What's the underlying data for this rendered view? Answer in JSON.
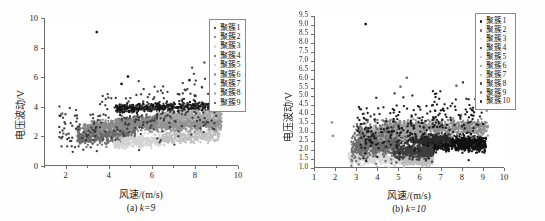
{
  "figure": {
    "background": "#ffffff",
    "axis_color": "#6b6b6b",
    "text_color": "#1a1a1a"
  },
  "chart_data": [
    {
      "id": "a",
      "type": "scatter",
      "title": "",
      "caption_prefix": "(a)",
      "caption_param": "k=9",
      "xlabel": "风速/(m/s)",
      "ylabel": "电压波动/V",
      "xlim": [
        1,
        10
      ],
      "ylim": [
        0,
        10
      ],
      "xticks": [
        2,
        4,
        6,
        8,
        10
      ],
      "xtick_labels": [
        "2",
        "4",
        "6",
        "8",
        "10"
      ],
      "xticks_minor": [
        1,
        3,
        5,
        7,
        9
      ],
      "yticks": [
        0,
        2,
        4,
        6,
        8,
        10
      ],
      "ytick_labels": [
        "0",
        "2",
        "4",
        "6",
        "8",
        "10"
      ],
      "grid": false,
      "legend_position": "top-right",
      "legend_title": "",
      "point_size": 1.15,
      "seed": 20249,
      "series": [
        {
          "name": "聚簇1",
          "color": "#141414",
          "n": 430,
          "shape": "band",
          "xrange": [
            4.3,
            8.9
          ],
          "ycenter_at_xmin": 3.85,
          "ycenter_at_xmax": 4.05,
          "yspread": 0.3,
          "xskew": 0.0
        },
        {
          "name": "聚簇2",
          "color": "#6d6d6d",
          "n": 520,
          "shape": "band",
          "xrange": [
            2.5,
            5.2
          ],
          "ycenter_at_xmin": 1.95,
          "ycenter_at_xmax": 2.35,
          "yspread": 0.55,
          "xskew": 0.0
        },
        {
          "name": "聚簇3",
          "color": "#d3d3d3",
          "n": 300,
          "shape": "band",
          "xrange": [
            4.2,
            6.6
          ],
          "ycenter_at_xmin": 1.55,
          "ycenter_at_xmax": 1.75,
          "yspread": 0.38,
          "xskew": 0.0
        },
        {
          "name": "聚簇4",
          "color": "#4f4f4f",
          "n": 480,
          "shape": "band",
          "xrange": [
            4.4,
            7.2
          ],
          "ycenter_at_xmin": 2.95,
          "ycenter_at_xmax": 3.15,
          "yspread": 0.3,
          "xskew": 0.0
        },
        {
          "name": "聚簇5",
          "color": "#c0c0c0",
          "n": 360,
          "shape": "band",
          "xrange": [
            6.4,
            9.1
          ],
          "ycenter_at_xmin": 1.95,
          "ycenter_at_xmax": 2.15,
          "yspread": 0.45,
          "xskew": 0.0
        },
        {
          "name": "聚簇6",
          "color": "#949494",
          "n": 620,
          "shape": "band",
          "xrange": [
            5.6,
            9.2
          ],
          "ycenter_at_xmin": 2.75,
          "ycenter_at_xmax": 2.9,
          "yspread": 0.38,
          "xskew": 0.0
        },
        {
          "name": "聚簇7",
          "color": "#8a8a8a",
          "n": 540,
          "shape": "band",
          "xrange": [
            2.8,
            6.2
          ],
          "ycenter_at_xmin": 2.55,
          "ycenter_at_xmax": 2.95,
          "yspread": 0.4,
          "xskew": 0.0
        },
        {
          "name": "聚簇8",
          "color": "#a8a8a8",
          "n": 400,
          "shape": "band",
          "xrange": [
            6.2,
            9.2
          ],
          "ycenter_at_xmin": 3.35,
          "ycenter_at_xmax": 3.45,
          "yspread": 0.38,
          "xskew": 0.0
        },
        {
          "name": "聚簇9",
          "color": "#3a3a3a",
          "n": 300,
          "shape": "scatter",
          "xrange": [
            1.6,
            9.0
          ],
          "ycenter_at_xmin": 2.6,
          "ycenter_at_xmax": 4.3,
          "yspread": 0.95,
          "xskew": 0.0
        }
      ],
      "outliers": [
        {
          "x": 3.4,
          "y": 9.05,
          "color": "#141414"
        },
        {
          "x": 4.85,
          "y": 6.05,
          "color": "#141414"
        },
        {
          "x": 4.55,
          "y": 5.55,
          "color": "#141414"
        },
        {
          "x": 7.7,
          "y": 5.8,
          "color": "#141414"
        },
        {
          "x": 1.8,
          "y": 3.55,
          "color": "#7a7a7a"
        },
        {
          "x": 1.85,
          "y": 2.2,
          "color": "#7a7a7a"
        }
      ]
    },
    {
      "id": "b",
      "type": "scatter",
      "title": "",
      "caption_prefix": "(b)",
      "caption_param": "k=10",
      "xlabel": "风速/(m/s)",
      "ylabel": "电压波动/V",
      "xlim": [
        1,
        10
      ],
      "ylim": [
        1.0,
        9.5
      ],
      "xticks": [
        1,
        2,
        3,
        4,
        5,
        6,
        7,
        8,
        9,
        10
      ],
      "xtick_labels": [
        "1",
        "2",
        "3",
        "4",
        "5",
        "6",
        "7",
        "8",
        "9",
        "10"
      ],
      "xticks_minor": [],
      "yticks": [
        1.0,
        1.5,
        2.0,
        2.5,
        3.0,
        3.5,
        4.0,
        4.5,
        5.0,
        5.5,
        6.0,
        6.5,
        7.0,
        7.5,
        8.0,
        8.5,
        9.0,
        9.5
      ],
      "ytick_labels": [
        "1.0",
        "1.5",
        "2.0",
        "2.5",
        "3.0",
        "3.5",
        "4.0",
        "4.5",
        "5.0",
        "5.5",
        "6.0",
        "6.5",
        "7.0",
        "7.5",
        "8.0",
        "8.5",
        "9.0",
        "9.5"
      ],
      "grid": false,
      "legend_position": "top-right",
      "legend_title": "",
      "point_size": 1.15,
      "seed": 77331,
      "series": [
        {
          "name": "聚簇1",
          "color": "#121212",
          "n": 760,
          "shape": "band",
          "xrange": [
            6.1,
            9.1
          ],
          "ycenter_at_xmin": 2.35,
          "ycenter_at_xmax": 2.4,
          "yspread": 0.42,
          "xskew": 0.0
        },
        {
          "name": "聚簇2",
          "color": "#5e5e5e",
          "n": 430,
          "shape": "band",
          "xrange": [
            2.9,
            5.0
          ],
          "ycenter_at_xmin": 2.1,
          "ycenter_at_xmax": 2.3,
          "yspread": 0.5,
          "xskew": 0.0
        },
        {
          "name": "聚簇3",
          "color": "#d8d8d8",
          "n": 520,
          "shape": "band",
          "xrange": [
            2.6,
            6.3
          ],
          "ycenter_at_xmin": 1.55,
          "ycenter_at_xmax": 1.45,
          "yspread": 0.32,
          "xskew": 0.0
        },
        {
          "name": "聚簇4",
          "color": "#2b2b2b",
          "n": 560,
          "shape": "band",
          "xrange": [
            4.8,
            7.4
          ],
          "ycenter_at_xmin": 2.7,
          "ycenter_at_xmax": 2.6,
          "yspread": 0.28,
          "xskew": 0.0
        },
        {
          "name": "聚簇5",
          "color": "#bdbdbd",
          "n": 300,
          "shape": "band",
          "xrange": [
            5.1,
            6.6
          ],
          "ycenter_at_xmin": 1.45,
          "ycenter_at_xmax": 1.4,
          "yspread": 0.26,
          "xskew": 0.0
        },
        {
          "name": "聚簇6",
          "color": "#8e8e8e",
          "n": 700,
          "shape": "band",
          "xrange": [
            4.3,
            9.2
          ],
          "ycenter_at_xmin": 3.3,
          "ycenter_at_xmax": 3.25,
          "yspread": 0.42,
          "xskew": 0.0
        },
        {
          "name": "聚簇7",
          "color": "#a4a4a4",
          "n": 480,
          "shape": "band",
          "xrange": [
            3.1,
            6.0
          ],
          "ycenter_at_xmin": 2.85,
          "ycenter_at_xmax": 3.05,
          "yspread": 0.4,
          "xskew": 0.0
        },
        {
          "name": "聚簇8",
          "color": "#3f3f3f",
          "n": 420,
          "shape": "band",
          "xrange": [
            4.7,
            6.6
          ],
          "ycenter_at_xmin": 1.95,
          "ycenter_at_xmax": 1.85,
          "yspread": 0.4,
          "xskew": 0.0
        },
        {
          "name": "聚簇9",
          "color": "#707070",
          "n": 360,
          "shape": "scatter",
          "xrange": [
            2.7,
            4.9
          ],
          "ycenter_at_xmin": 2.2,
          "ycenter_at_xmax": 2.7,
          "yspread": 0.55,
          "xskew": 0.0
        },
        {
          "name": "聚簇10",
          "color": "#1d1d1d",
          "n": 300,
          "shape": "scatter",
          "xrange": [
            3.0,
            9.0
          ],
          "ycenter_at_xmin": 2.9,
          "ycenter_at_xmax": 3.9,
          "yspread": 0.8,
          "xskew": 0.0
        }
      ],
      "outliers": [
        {
          "x": 3.4,
          "y": 9.05,
          "color": "#121212"
        },
        {
          "x": 5.35,
          "y": 6.05,
          "color": "#707070"
        },
        {
          "x": 5.05,
          "y": 5.55,
          "color": "#707070"
        },
        {
          "x": 7.7,
          "y": 5.6,
          "color": "#707070"
        },
        {
          "x": 1.8,
          "y": 3.55,
          "color": "#8e8e8e"
        },
        {
          "x": 1.85,
          "y": 2.8,
          "color": "#8e8e8e"
        }
      ]
    }
  ]
}
